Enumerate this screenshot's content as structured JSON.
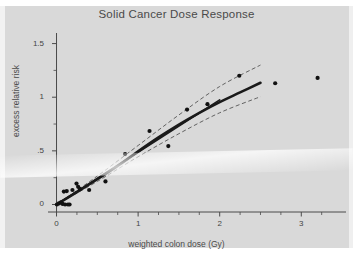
{
  "figure": {
    "background_color": "#d9d9d9",
    "title": "Solid Cancer Dose Response",
    "axis_color": "#4a4a4a",
    "fit_color": "#1a1a1a",
    "point_color": "#111111",
    "ci_color": "#555555"
  },
  "chart_data": {
    "type": "scatter",
    "title": "Solid Cancer Dose Response",
    "xlabel": "weighted colon dose (Gy)",
    "ylabel": "excess relative risk",
    "xlim": [
      -0.08,
      3.45
    ],
    "ylim": [
      -0.07,
      1.58
    ],
    "grid": false,
    "legend": "none",
    "xticks": [
      0,
      1,
      2,
      3
    ],
    "xticklabels": [
      "0",
      "1",
      "2",
      "3"
    ],
    "xminorticks": [
      0.25,
      0.5,
      0.75,
      1.25,
      1.5,
      1.75,
      2.25,
      2.5,
      2.75,
      3.25
    ],
    "yticks": [
      0,
      0.5,
      1,
      1.5
    ],
    "yticklabels": [
      "0",
      ".5",
      "1",
      "1.5"
    ],
    "yminorticks": [
      0.25,
      0.75,
      1.25
    ],
    "series": [
      {
        "name": "category-specific ERR estimates",
        "type": "scatter",
        "marker": "filled-circle",
        "points": [
          {
            "x": 0.005,
            "y": 0.0
          },
          {
            "x": 0.03,
            "y": 0.01
          },
          {
            "x": 0.055,
            "y": 0.02
          },
          {
            "x": 0.075,
            "y": 0.005
          },
          {
            "x": 0.09,
            "y": 0.12
          },
          {
            "x": 0.105,
            "y": 0.0
          },
          {
            "x": 0.125,
            "y": 0.125
          },
          {
            "x": 0.14,
            "y": 0.0
          },
          {
            "x": 0.16,
            "y": 0.0
          },
          {
            "x": 0.195,
            "y": 0.135
          },
          {
            "x": 0.245,
            "y": 0.195
          },
          {
            "x": 0.265,
            "y": 0.165
          },
          {
            "x": 0.285,
            "y": 0.145
          },
          {
            "x": 0.4,
            "y": 0.135
          },
          {
            "x": 0.6,
            "y": 0.215
          },
          {
            "x": 0.84,
            "y": 0.47
          },
          {
            "x": 1.14,
            "y": 0.685
          },
          {
            "x": 1.37,
            "y": 0.545
          },
          {
            "x": 1.6,
            "y": 0.885
          },
          {
            "x": 1.85,
            "y": 0.935
          },
          {
            "x": 2.24,
            "y": 1.2
          },
          {
            "x": 2.68,
            "y": 1.13
          },
          {
            "x": 3.2,
            "y": 1.18
          }
        ]
      },
      {
        "name": "linear-quadratic fit",
        "type": "line",
        "style": "solid-thick",
        "points": [
          {
            "x": 0.0,
            "y": 0.0
          },
          {
            "x": 0.25,
            "y": 0.115
          },
          {
            "x": 0.5,
            "y": 0.235
          },
          {
            "x": 0.75,
            "y": 0.36
          },
          {
            "x": 1.0,
            "y": 0.495
          },
          {
            "x": 1.25,
            "y": 0.625
          },
          {
            "x": 1.5,
            "y": 0.745
          },
          {
            "x": 1.75,
            "y": 0.855
          },
          {
            "x": 2.0,
            "y": 0.955
          },
          {
            "x": 2.25,
            "y": 1.045
          },
          {
            "x": 2.5,
            "y": 1.135
          }
        ]
      },
      {
        "name": "linear fit",
        "type": "line",
        "style": "solid-medium",
        "points": [
          {
            "x": 0.0,
            "y": 0.0
          },
          {
            "x": 2.0,
            "y": 0.975
          }
        ]
      },
      {
        "name": "upper 95% confidence bound",
        "type": "line",
        "style": "dashed",
        "points": [
          {
            "x": 0.0,
            "y": 0.0
          },
          {
            "x": 0.5,
            "y": 0.265
          },
          {
            "x": 1.0,
            "y": 0.55
          },
          {
            "x": 1.5,
            "y": 0.835
          },
          {
            "x": 2.0,
            "y": 1.1
          },
          {
            "x": 2.5,
            "y": 1.3
          }
        ]
      },
      {
        "name": "lower 95% confidence bound",
        "type": "line",
        "style": "dashed",
        "points": [
          {
            "x": 0.0,
            "y": 0.0
          },
          {
            "x": 0.5,
            "y": 0.215
          },
          {
            "x": 1.0,
            "y": 0.445
          },
          {
            "x": 1.5,
            "y": 0.66
          },
          {
            "x": 2.0,
            "y": 0.855
          },
          {
            "x": 2.5,
            "y": 1.005
          }
        ]
      }
    ]
  }
}
